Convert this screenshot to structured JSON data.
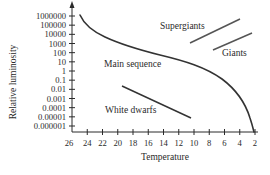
{
  "chart_data": {
    "type": "line",
    "title": "",
    "xlabel": "Temperature",
    "ylabel": "Relative luminosity",
    "x_ticks": [
      "26",
      "24",
      "22",
      "20",
      "18",
      "16",
      "14",
      "12",
      "10",
      "8",
      "6",
      "4",
      "2"
    ],
    "x_tick_values": [
      26,
      24,
      22,
      20,
      18,
      16,
      14,
      12,
      10,
      8,
      6,
      4,
      2
    ],
    "x_reversed": true,
    "y_ticks": [
      "1000000",
      "100000",
      "10000",
      "1000",
      "100",
      "10",
      "1",
      "0.1",
      "0.01",
      "0.001",
      "0.0001",
      "0.00001",
      "0.000001"
    ],
    "y_scale": "log",
    "xlim": [
      26,
      2
    ],
    "ylim": [
      1e-06,
      1000000
    ],
    "grid": false,
    "legend": "none",
    "series": [
      {
        "name": "Main sequence",
        "kind": "curve",
        "points": [
          [
            25.3,
            1000000
          ],
          [
            24.6,
            100000
          ],
          [
            23.3,
            20000
          ],
          [
            21.5,
            5000
          ],
          [
            19,
            1500
          ],
          [
            16.5,
            500
          ],
          [
            14,
            200
          ],
          [
            11.5,
            60
          ],
          [
            8.5,
            15
          ],
          [
            6.5,
            2
          ],
          [
            4.5,
            0.05
          ],
          [
            3.5,
            0.0005
          ],
          [
            2,
            1e-06
          ]
        ]
      },
      {
        "name": "Supergiants",
        "kind": "segment",
        "points": [
          [
            10.5,
            300
          ],
          [
            4,
            100000
          ]
        ]
      },
      {
        "name": "Giants",
        "kind": "segment",
        "points": [
          [
            7.5,
            50
          ],
          [
            2.5,
            3000
          ]
        ]
      },
      {
        "name": "White dwarfs",
        "kind": "segment",
        "points": [
          [
            19.7,
            0.5
          ],
          [
            10.7,
            0.0004
          ]
        ]
      }
    ],
    "annotations": [
      {
        "text": "Supergiants",
        "near": "upper right"
      },
      {
        "text": "Giants",
        "near": "right"
      },
      {
        "text": "Main sequence",
        "near": "center"
      },
      {
        "text": "White dwarfs",
        "near": "lower center"
      }
    ]
  },
  "labels": {
    "supergiants": "Supergiants",
    "giants": "Giants",
    "main_sequence": "Main sequence",
    "white_dwarfs": "White dwarfs",
    "xlabel": "Temperature",
    "ylabel": "Relative luminosity"
  },
  "colors": {
    "ink": "#2a2a2a",
    "curve": "#333333",
    "background": "#ffffff"
  }
}
